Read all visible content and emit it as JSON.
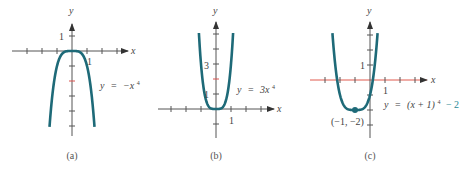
{
  "colors": {
    "curve": "#1e6a78",
    "axis": "#555555",
    "highlight_axis": "#e05a4e",
    "highlight_tick": "#d9534f",
    "teal_text": "#2a8a96"
  },
  "chart_data": [
    {
      "type": "line",
      "caption": "(a)",
      "function": "y = -x^4",
      "equation_parts": {
        "lhs": "y",
        "eq": "=",
        "rhs": "−x",
        "exp": "4"
      },
      "xlabel": "x",
      "ylabel": "y",
      "xlim": [
        -3,
        3
      ],
      "ylim": [
        -5,
        1
      ],
      "x_tick_values": [
        -3,
        -2,
        -1,
        1,
        2,
        3
      ],
      "y_tick_values": [
        1,
        -1,
        -2,
        -3,
        -4,
        -5
      ],
      "highlight_y_tick": -2,
      "labeled_ticks": {
        "x": {
          "value": 1,
          "label": "1"
        },
        "y": {
          "value": 1,
          "label": "1"
        }
      },
      "curve_x_range": [
        -1.5,
        1.5
      ],
      "series": [
        {
          "name": "y = -x^4",
          "coef": -1,
          "shift_x": 0,
          "shift_y": 0
        }
      ]
    },
    {
      "type": "line",
      "caption": "(b)",
      "function": "y = 3x^4",
      "equation_parts": {
        "lhs": "y",
        "eq": "=",
        "rhs": "3x",
        "exp": "4"
      },
      "xlabel": "x",
      "ylabel": "y",
      "xlim": [
        -3,
        3
      ],
      "ylim": [
        -1,
        5
      ],
      "x_tick_values": [
        -3,
        -2,
        -1,
        1,
        2,
        3
      ],
      "y_tick_values": [
        -1,
        1,
        2,
        3,
        4,
        5
      ],
      "highlight_y_tick": 2,
      "labeled_ticks": {
        "x": {
          "value": 1,
          "label": "1"
        },
        "y1": {
          "value": 1,
          "label": "1"
        },
        "y3": {
          "value": 3,
          "label": "3"
        }
      },
      "curve_x_range": [
        -1.14,
        1.14
      ],
      "series": [
        {
          "name": "y = 3x^4",
          "coef": 3,
          "shift_x": 0,
          "shift_y": 0
        }
      ]
    },
    {
      "type": "line",
      "caption": "(c)",
      "function": "y = (x+1)^4 - 2",
      "equation_parts": {
        "lhs": "y",
        "eq": "=",
        "rhs": "(x + 1)",
        "exp": "4",
        "tail": "− 2"
      },
      "xlabel": "x",
      "ylabel": "y",
      "xlim": [
        -3,
        3
      ],
      "ylim": [
        -4,
        3
      ],
      "x_tick_values": [
        -3,
        -2,
        -1,
        1,
        2,
        3
      ],
      "y_tick_values": [
        1,
        2,
        3,
        -1,
        -2,
        -3
      ],
      "labeled_ticks": {
        "x": {
          "value": 1,
          "label": "1"
        },
        "y": {
          "value": 1,
          "label": "1"
        }
      },
      "curve_x_range": [
        -2.505,
        0.505
      ],
      "series": [
        {
          "name": "y = (x+1)^4 - 2",
          "coef": 1,
          "shift_x": -1,
          "shift_y": -2
        }
      ],
      "annotations": [
        {
          "x": -1,
          "y": -2,
          "label": "(−1, −2)",
          "marker": "dot"
        }
      ]
    }
  ]
}
